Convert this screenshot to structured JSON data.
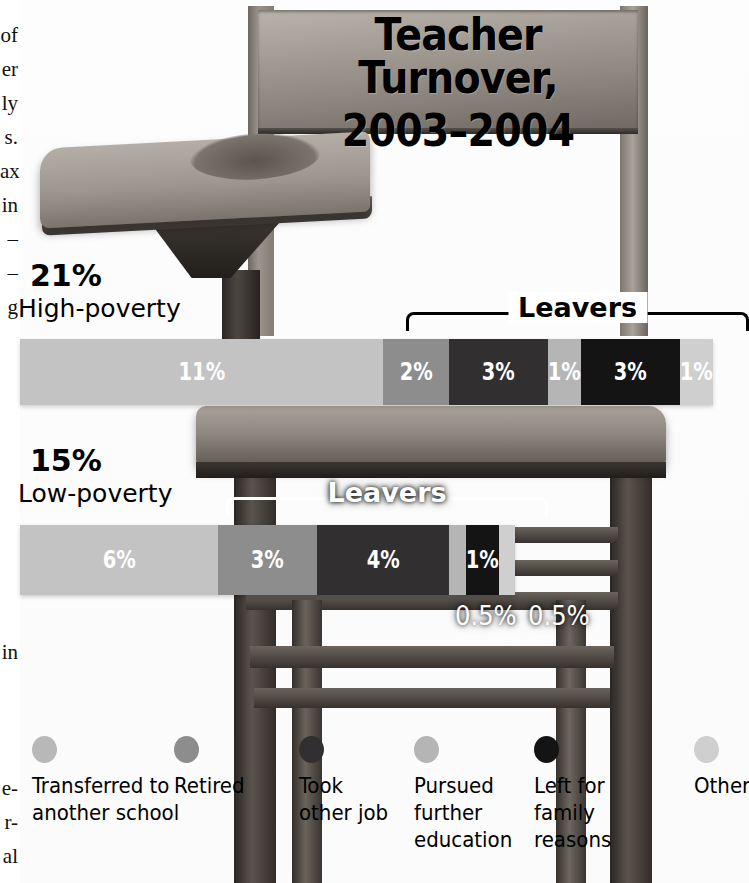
{
  "title": {
    "line1": "Teacher Turnover,",
    "line2": "2003–2004"
  },
  "margin_text": {
    "top_fragments": "of\ner\nly\ns.\nax\nin\n–\n–\ng",
    "bottom_fragments": "in\n\n\n\ne-\nr-\nal"
  },
  "groups": [
    {
      "id": "high-poverty",
      "percent": "21%",
      "name": "High-poverty",
      "leavers_label": "Leavers",
      "segments": [
        {
          "label": "11%",
          "value": 11,
          "color": "#c3c3c3",
          "text_color": "#ffffff",
          "show_label": true
        },
        {
          "label": "2%",
          "value": 2,
          "color": "#8d8d8d",
          "text_color": "#ffffff",
          "show_label": true
        },
        {
          "label": "3%",
          "value": 3,
          "color": "#312f2f",
          "text_color": "#ffffff",
          "show_label": true
        },
        {
          "label": "1%",
          "value": 1,
          "color": "#b5b5b5",
          "text_color": "#ffffff",
          "show_label": true
        },
        {
          "label": "3%",
          "value": 3,
          "color": "#141414",
          "text_color": "#ffffff",
          "show_label": true
        },
        {
          "label": "1%",
          "value": 1,
          "color": "#cfcfcf",
          "text_color": "#ffffff",
          "show_label": true
        }
      ]
    },
    {
      "id": "low-poverty",
      "percent": "15%",
      "name": "Low-poverty",
      "leavers_label": "Leavers",
      "segments": [
        {
          "label": "6%",
          "value": 6,
          "color": "#c3c3c3",
          "text_color": "#ffffff",
          "show_label": true
        },
        {
          "label": "3%",
          "value": 3,
          "color": "#8d8d8d",
          "text_color": "#ffffff",
          "show_label": true
        },
        {
          "label": "4%",
          "value": 4,
          "color": "#312f2f",
          "text_color": "#ffffff",
          "show_label": true
        },
        {
          "label": "0.5%",
          "value": 0.5,
          "color": "#b5b5b5",
          "text_color": "#ffffff",
          "show_label": false
        },
        {
          "label": "1%",
          "value": 1,
          "color": "#141414",
          "text_color": "#ffffff",
          "show_label": true
        },
        {
          "label": "0.5%",
          "value": 0.5,
          "color": "#cfcfcf",
          "text_color": "#ffffff",
          "show_label": false
        }
      ],
      "callouts": [
        {
          "label": "0.5%"
        },
        {
          "label": "0.5%"
        }
      ]
    }
  ],
  "legend": {
    "items": [
      {
        "label": "Transferred to\nanother school",
        "color": "#b8b8b8"
      },
      {
        "label": "Retired",
        "color": "#8d8d8d"
      },
      {
        "label": "Took\nother job",
        "color": "#312f2f"
      },
      {
        "label": "Pursued\nfurther\neducation",
        "color": "#b5b5b5"
      },
      {
        "label": "Left for\nfamily\nreasons",
        "color": "#141414"
      },
      {
        "label": "Other",
        "color": "#cfcfcf"
      }
    ]
  },
  "chart_data": {
    "type": "bar",
    "title": "Teacher Turnover, 2003–2004",
    "subtype": "stacked-horizontal",
    "categories": [
      "High-poverty",
      "Low-poverty"
    ],
    "totals": [
      21,
      15
    ],
    "unit": "percent",
    "series": [
      {
        "name": "Transferred to another school",
        "values": [
          11,
          6
        ],
        "color": "#c3c3c3"
      },
      {
        "name": "Retired",
        "values": [
          2,
          3
        ],
        "color": "#8d8d8d"
      },
      {
        "name": "Took other job",
        "values": [
          3,
          4
        ],
        "color": "#312f2f"
      },
      {
        "name": "Pursued further education",
        "values": [
          1,
          0.5
        ],
        "color": "#b5b5b5"
      },
      {
        "name": "Left for family reasons",
        "values": [
          3,
          1
        ],
        "color": "#141414"
      },
      {
        "name": "Other",
        "values": [
          1,
          0.5
        ],
        "color": "#cfcfcf"
      }
    ],
    "annotations": [
      {
        "text": "Leavers",
        "applies_to": "High-poverty",
        "covers_series": [
          "Retired",
          "Took other job",
          "Pursued further education",
          "Left for family reasons",
          "Other"
        ]
      },
      {
        "text": "Leavers",
        "applies_to": "Low-poverty",
        "covers_series": [
          "Retired",
          "Took other job",
          "Pursued further education",
          "Left for family reasons",
          "Other"
        ]
      }
    ],
    "xlabel": "",
    "ylabel": "",
    "xlim": [
      0,
      21
    ],
    "grid": false,
    "legend_position": "bottom"
  }
}
